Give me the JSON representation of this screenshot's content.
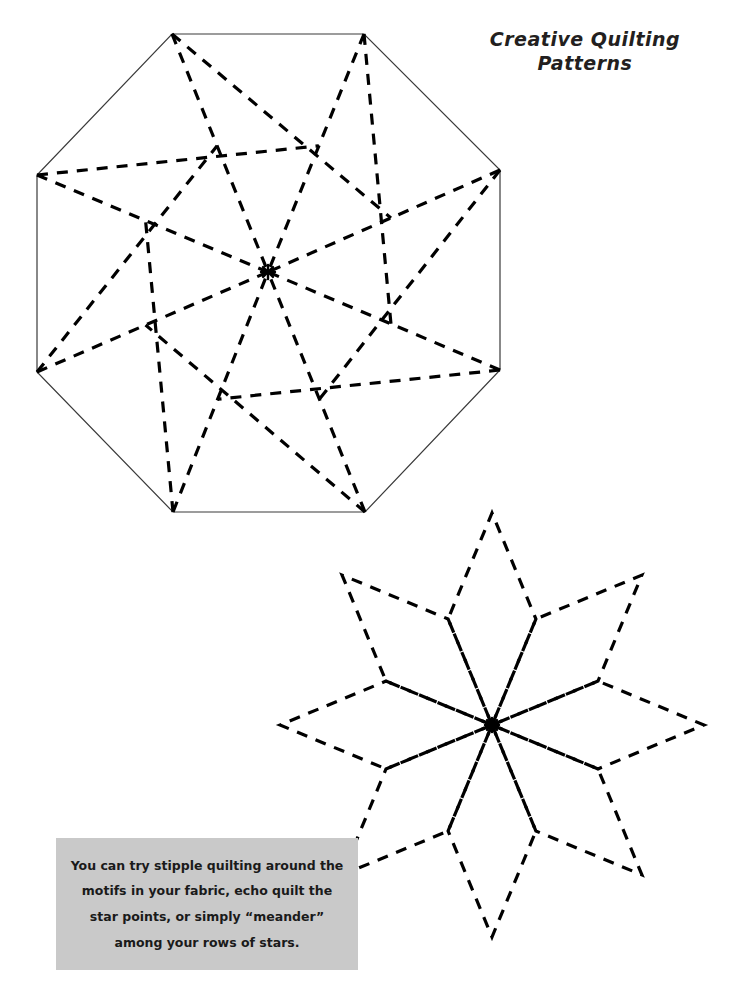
{
  "document": {
    "background_color": "#ffffff",
    "page_width": 729,
    "page_height": 994
  },
  "title": {
    "full_text": "Creative Quilting Patterns",
    "line1": "Creative Quilting",
    "line2": "Patterns",
    "color": "#231f20"
  },
  "caption": {
    "full_text": "You can try stipple quilting around the motifs in your fabric, echo quilt the star points, or simply \"meander\" among your rows of stars.",
    "line1": "You can try stipple quilting around the",
    "line2": "motifs in your fabric, echo quilt the",
    "line3": "star points, or simply “meander”",
    "line4": "among your rows of stars.",
    "background_color": "#c9c9c9",
    "text_color": "#1a1a1a"
  },
  "figures": {
    "octagon_pinwheel": {
      "name": "Octagon pinwheel quilting block",
      "outline_style": "solid",
      "outline_color": "#3a3a3a",
      "outline_width": 1.2,
      "dash_color": "#000000",
      "dash_width": 3.2,
      "dash_pattern": "11,9",
      "center": [
        268,
        272
      ],
      "radius": 168,
      "sides": 8,
      "rotation_degrees": 22.5,
      "vertices": [
        [
          172,
          34
        ],
        [
          364,
          34
        ],
        [
          500,
          170
        ],
        [
          500,
          370
        ],
        [
          365,
          512
        ],
        [
          173,
          512
        ],
        [
          37,
          372
        ],
        [
          37,
          175
        ]
      ],
      "center_marker": "asterisk",
      "pinwheel_offset_ratio": 0.47
    },
    "lemoyne_star": {
      "name": "Eight-pointed LeMoyne star quilting block",
      "outline_style": "dashed",
      "dash_color": "#000000",
      "dash_width": 3.2,
      "dash_pattern": "11,9",
      "center": [
        492,
        725
      ],
      "point_radius": 212,
      "points": 8,
      "diamond_half_angle_degrees": 22.5,
      "center_marker": "asterisk",
      "tips": [
        [
          492,
          513
        ],
        [
          642,
          575
        ],
        [
          704,
          725
        ],
        [
          642,
          875
        ],
        [
          492,
          937
        ],
        [
          342,
          875
        ],
        [
          280,
          725
        ],
        [
          342,
          575
        ]
      ]
    }
  }
}
